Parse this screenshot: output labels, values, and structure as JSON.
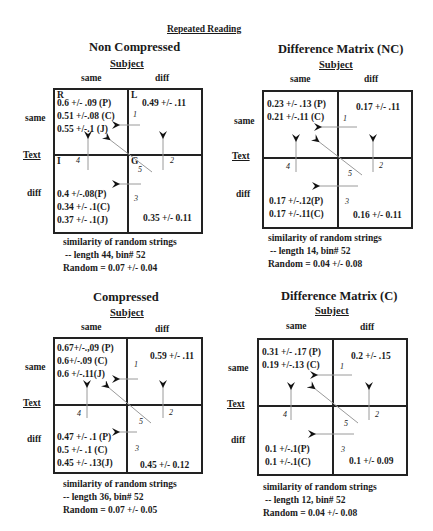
{
  "title": "Repeated Reading",
  "panels": {
    "nc": {
      "title": "Non Compressed",
      "subject_label": "Subject",
      "col_same": "same",
      "col_diff": "diff",
      "row_same": "same",
      "row_text": "Text",
      "row_diff": "diff",
      "quad_labels": {
        "tl": "R",
        "tr": "L",
        "bl": "I",
        "br": "G"
      },
      "tl": [
        "0.6 +/- .09 (P)",
        "0.51 +/-.08 (C)",
        "0.55 +/-.1 (J)"
      ],
      "tr": [
        "0.49 +/- .11"
      ],
      "bl": [
        "0.4 +/-.08(P)",
        "0.34 +/- .1(C)",
        "0.37 +/- .1(J)"
      ],
      "br": [
        "0.35 +/- 0.11"
      ],
      "arrow_numbers": [
        "1",
        "2",
        "3",
        "4",
        "5"
      ],
      "footer": [
        "similarity of random strings",
        "-- length 44, bin# 52",
        "Random = 0.07 +/- 0.04"
      ]
    },
    "dnc": {
      "title": "Difference Matrix (NC)",
      "subject_label": "Subject",
      "col_same": "same",
      "col_diff": "diff",
      "row_same": "same",
      "row_text": "Text",
      "row_diff": "diff",
      "tl": [
        "0.23 +/- .13 (P)",
        "0.21 +/-.11 (C)"
      ],
      "tr": [
        "0.17 +/- .11"
      ],
      "bl": [
        "0.17 +/-.12(P)",
        "0.17 +/-.11(C)"
      ],
      "br": [
        "0.16 +/- 0.11"
      ],
      "arrow_numbers": [
        "1",
        "2",
        "3",
        "4",
        "5"
      ],
      "footer": [
        "similarity of random strings",
        "-- length 14, bin# 52",
        "Random = 0.04 +/- 0.08"
      ]
    },
    "c": {
      "title": "Compressed",
      "subject_label": "Subject",
      "col_same": "same",
      "col_diff": "diff",
      "row_same": "same",
      "row_text": "Text",
      "row_diff": "diff",
      "tl": [
        "0.67+/-.,09 (P)",
        "0.6+/-.09 (C)",
        "0.6 +/-.11(J)"
      ],
      "tr": [
        "0.59 +/- .11"
      ],
      "bl": [
        "0.47 +/- .1 (P)",
        "0.5 +/- .1 (C)",
        "0.45 +/- .13(J)"
      ],
      "br": [
        "0.45 +/- 0.12"
      ],
      "arrow_numbers": [
        "1",
        "2",
        "3",
        "4",
        "5"
      ],
      "footer": [
        "similarity of random strings",
        "-- length 36, bin# 52",
        "Random = 0.07 +/- 0.05"
      ]
    },
    "dc": {
      "title": "Difference Matrix (C)",
      "subject_label": "Subject",
      "col_same": "same",
      "col_diff": "diff",
      "row_same": "same",
      "row_text": "Text",
      "row_diff": "diff",
      "tl": [
        "0.31 +/- .17 (P)",
        "0.19 +/-.13 (C)"
      ],
      "tr": [
        "0.2 +/- .15"
      ],
      "bl": [
        "0.1 +/-.1(P)",
        "0.1 +/-.1(C)"
      ],
      "br": [
        "0.1 +/- 0.09"
      ],
      "arrow_numbers": [
        "1",
        "2",
        "3",
        "4",
        "5"
      ],
      "footer": [
        "similarity of random strings",
        "-- length 12, bin# 52",
        "Random = 0.04 +/- 0.08"
      ]
    }
  },
  "colors": {
    "ink": "#1a1a1a",
    "arrow": "#9a9a9a",
    "arrowhead": "#111111",
    "background": "#ffffff"
  }
}
